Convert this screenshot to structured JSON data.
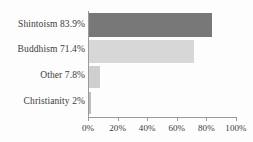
{
  "chart_data": {
    "type": "bar",
    "orientation": "horizontal",
    "title": "",
    "xlabel": "",
    "ylabel": "",
    "xlim": [
      0,
      100
    ],
    "grid": false,
    "legend": null,
    "categories": [
      "Shintoism",
      "Buddhism",
      "Other",
      "Christianity"
    ],
    "values": [
      83.9,
      71.4,
      7.8,
      2
    ],
    "value_labels": [
      "83.9%",
      "71.4%",
      "7.8%",
      "2%"
    ],
    "category_labels": [
      "Shintoism 83.9%",
      "Buddhism 71.4%",
      "Other 7.8%",
      "Christianity 2%"
    ],
    "bar_colors": [
      "#787878",
      "#d7d7d7",
      "#cfcfcf",
      "#bdbdbd"
    ],
    "xticks": [
      0,
      20,
      40,
      60,
      80,
      100
    ],
    "xtick_labels": [
      "0%",
      "20%",
      "40%",
      "60%",
      "80%",
      "100%"
    ],
    "axis_color": "#9a9a9a",
    "text_color": "#3b3b3b",
    "background_color": "#fdfdfd"
  }
}
